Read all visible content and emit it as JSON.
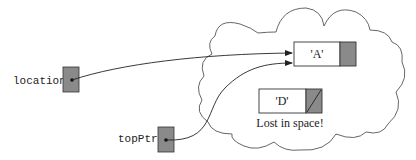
{
  "diagram": {
    "type": "linked-node-memory-diagram",
    "pointers": [
      {
        "id": "location",
        "label": "location",
        "points_to": "A"
      },
      {
        "id": "topPtr",
        "label": "topPtr",
        "points_to": "A"
      }
    ],
    "nodes": [
      {
        "id": "A",
        "value": "'A'",
        "next": "shaded (non-null)"
      },
      {
        "id": "D",
        "value": "'D'",
        "next": "null (diagonal slash)"
      }
    ],
    "cloud_label": "heap",
    "caption": "Lost in space!",
    "colors": {
      "pointer_fill": "#8a8a8a",
      "node_fill": "#ffffff",
      "stroke": "#333333"
    }
  }
}
